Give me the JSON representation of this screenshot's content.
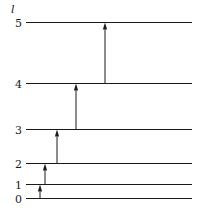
{
  "figure": {
    "kind": "energy-level-diagram",
    "width": 199,
    "height": 212,
    "background_color": "#ffffff",
    "ink_color": "#1a1a1a"
  },
  "axis": {
    "label": "l",
    "label_x": 11,
    "label_y": 4
  },
  "levels": [
    {
      "label": "5",
      "value": 5,
      "y": 22.5,
      "x_start": 26,
      "x_end": 192,
      "label_x": 10,
      "label_y": 18
    },
    {
      "label": "4",
      "value": 4,
      "y": 83.5,
      "x_start": 26,
      "x_end": 192,
      "label_x": 10,
      "label_y": 79
    },
    {
      "label": "3",
      "value": 3,
      "y": 129.5,
      "x_start": 26,
      "x_end": 192,
      "label_x": 10,
      "label_y": 125
    },
    {
      "label": "2",
      "value": 2,
      "y": 163.5,
      "x_start": 26,
      "x_end": 192,
      "label_x": 10,
      "label_y": 159
    },
    {
      "label": "1",
      "value": 1,
      "y": 184.5,
      "x_start": 26,
      "x_end": 192,
      "label_x": 10,
      "label_y": 180
    },
    {
      "label": "0",
      "value": 0,
      "y": 198.5,
      "x_start": 26,
      "x_end": 192,
      "label_x": 10,
      "label_y": 194
    }
  ],
  "transitions": [
    {
      "name": "transition-0-to-1",
      "from": 0,
      "to": 1,
      "x": 40,
      "y_start": 198.5,
      "y_end": 184.5
    },
    {
      "name": "transition-1-to-2",
      "from": 1,
      "to": 2,
      "x": 45,
      "y_start": 184.5,
      "y_end": 163.5
    },
    {
      "name": "transition-2-to-3",
      "from": 2,
      "to": 3,
      "x": 57,
      "y_start": 163.5,
      "y_end": 129.5
    },
    {
      "name": "transition-3-to-4",
      "from": 3,
      "to": 4,
      "x": 76,
      "y_start": 129.5,
      "y_end": 83.5
    },
    {
      "name": "transition-4-to-5",
      "from": 4,
      "to": 5,
      "x": 105,
      "y_start": 83.5,
      "y_end": 22.5
    }
  ],
  "style": {
    "level_line_width": 1.2,
    "arrow_line_width": 1.0,
    "arrow_head_width": 4.2,
    "arrow_head_length": 7
  }
}
